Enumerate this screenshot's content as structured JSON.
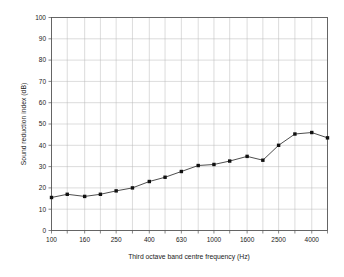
{
  "chart_data": {
    "type": "line",
    "title": "",
    "xlabel": "Third octave band centre frequency (Hz)",
    "ylabel": "Sound reduction index (dB)",
    "x_scale": "log",
    "categories": [
      100,
      125,
      160,
      200,
      250,
      315,
      400,
      500,
      630,
      800,
      1000,
      1250,
      1600,
      2000,
      2500,
      3150,
      4000,
      5000
    ],
    "values": [
      15.5,
      17.0,
      16.0,
      17.0,
      18.6,
      20.0,
      23.0,
      25.0,
      27.7,
      30.5,
      31.0,
      32.6,
      34.8,
      33.0,
      40.0,
      45.3,
      46.0,
      43.5
    ],
    "x_tick_labels": [
      "100",
      "160",
      "250",
      "400",
      "630",
      "1000",
      "1600",
      "2500",
      "4000"
    ],
    "x_tick_values": [
      100,
      160,
      250,
      400,
      630,
      1000,
      1600,
      2500,
      4000
    ],
    "x_minor_ticks": [
      125,
      200,
      315,
      500,
      800,
      1250,
      2000,
      3150,
      5000
    ],
    "y_tick_labels": [
      "0",
      "10",
      "20",
      "30",
      "40",
      "50",
      "60",
      "70",
      "80",
      "90",
      "100"
    ],
    "y_tick_values": [
      0,
      10,
      20,
      30,
      40,
      50,
      60,
      70,
      80,
      90,
      100
    ],
    "ylim": [
      0,
      100
    ],
    "xlim": [
      100,
      5000
    ],
    "grid": true,
    "legend": "none",
    "marker": "square",
    "line_color": "#3a3a3a",
    "marker_color": "#111111",
    "grid_color": "#b9b9b9",
    "axis_color": "#555555",
    "series": [
      {
        "name": "Sound reduction index",
        "values": [
          15.5,
          17.0,
          16.0,
          17.0,
          18.6,
          20.0,
          23.0,
          25.0,
          27.7,
          30.5,
          31.0,
          32.6,
          34.8,
          33.0,
          40.0,
          45.3,
          46.0,
          43.5
        ]
      }
    ]
  }
}
